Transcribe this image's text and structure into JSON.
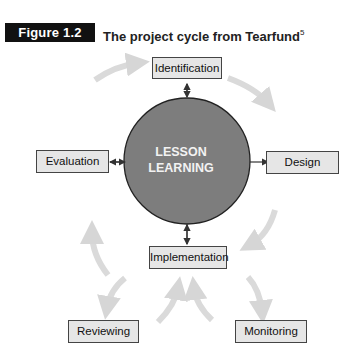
{
  "figure": {
    "label": "Figure 1.2",
    "title": "The project cycle from Tearfund",
    "footnote": "5"
  },
  "center": {
    "line1": "LESSON",
    "line2": "LEARNING",
    "fill": "#7d7d7d"
  },
  "nodes": {
    "identification": "Identification",
    "evaluation": "Evaluation",
    "design": "Design",
    "implementation": "Implementation",
    "reviewing": "Reviewing",
    "monitoring": "Monitoring"
  },
  "colors": {
    "box_fill": "#e6e6e6",
    "box_border": "#444444",
    "cycle_arrow": "#d9d9d9",
    "figure_label_bg": "#111111"
  }
}
